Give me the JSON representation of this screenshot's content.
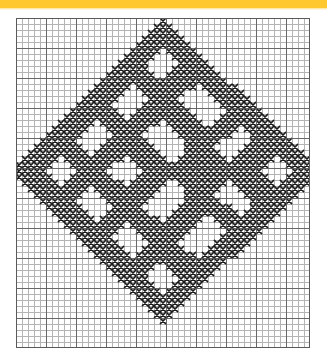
{
  "document": {
    "type": "cross-stitch-chart",
    "background_color": "#ffffff"
  },
  "banner": {
    "color": "#ffc82e",
    "height_px": 8,
    "label": ""
  },
  "chart_data": {
    "type": "heatmap",
    "title": "",
    "subtitle": "",
    "xlabel": "",
    "ylabel": "",
    "grid": true,
    "legend_position": "none",
    "columns": 49,
    "rows": 55,
    "cell_px": 6,
    "origin_x_px": 16,
    "origin_y_px": 18,
    "stitch_symbol": "X",
    "stitch_color": "#1a1a1a",
    "empty_color": "#ffffff",
    "thin_line_color": "#b4b4b4",
    "heavy_line_color": "#5a5a5a",
    "heavy_line_every": 5,
    "x": [
      0,
      1,
      2,
      3,
      4,
      5,
      6,
      7,
      8,
      9,
      10,
      11,
      12,
      13,
      14,
      15,
      16,
      17,
      18,
      19,
      20,
      21,
      22,
      23,
      24,
      25,
      26,
      27,
      28,
      29,
      30,
      31,
      32,
      33,
      34,
      35,
      36,
      37,
      38,
      39,
      40,
      41,
      42,
      43,
      44,
      45,
      46,
      47,
      48
    ],
    "pattern_rows": [
      "0000000000000000000000001000000000000000000000000",
      "0000000000000000000000011100000000000000000000000",
      "0000000000000000000000111110000000000000000000000",
      "0000000000000000000001111111000000000000000000000",
      "0000000000000000000011111111100000000000000000000",
      "0000000000000000000111110111110000000000000000000",
      "0000000000000000001111100011111000000000000000000",
      "0000000000000000011111000001111100000000000000000",
      "0000000000000000111111000011111110000000000000000",
      "0000000000000001111111100111111111000000000000000",
      "0000000000000011111111111111111111100000000000000",
      "0000000000000111111011111111110111111000000000000",
      "0000000000001111110001111111000011111100000000000",
      "0000000000011111100000111110000001111110000000000",
      "0000000000111111000001111111000000111111000000000",
      "0000000001111111100011111111100000011111100000000",
      "0000000011111111110111111111110000111111110000000",
      "0000000111111011111111110111111001111111111000000",
      "0000001111110001111111000011111111111011111100000",
      "0000011111100000111110000001111111110001111110000",
      "0000111111000001111111000000111111000001111111000",
      "0001111111100011111111100000111110000011111111100",
      "0011111111110111111111110000111111000111111111110",
      "0111111011111111110111111001111111101111111011111",
      "1111110001111111000011111111111111111111110001111",
      "1111100000111110000001111111111111111111100000111",
      "1111110001111111000011111111111111111111110001111",
      "0111111011111111110111111001111111101111111011111",
      "0011111111110111111111110000111111000111111111110",
      "0001111111100011111111100000111110000011111111100",
      "0000111111000001111111000000111111000001111111000",
      "0000011111100000111110000001111111110001111110000",
      "0000001111110001111111000011111111111011111100000",
      "0000000111111011111111110111111001111111111000000",
      "0000000011111111110111111111110000111111110000000",
      "0000000001111111100011111111100000011111100000000",
      "0000000000111111000001111111000000111111000000000",
      "0000000000011111100000111110000001111110000000000",
      "0000000000001111110001111111000011111100000000000",
      "0000000000000111111011111111110111111000000000000",
      "0000000000000011111111111111111111100000000000000",
      "0000000000000001111111100111111111000000000000000",
      "0000000000000000111111000011111110000000000000000",
      "0000000000000000011111000001111100000000000000000",
      "0000000000000000001111100011111000000000000000000",
      "0000000000000000000111110111110000000000000000000",
      "0000000000000000000011111111100000000000000000000",
      "0000000000000000000001111111000000000000000000000",
      "0000000000000000000000111110000000000000000000000",
      "0000000000000000000000011100000000000000000000000",
      "0000000000000000000000001000000000000000000000000",
      "0000000000000000000000000000000000000000000000000",
      "0000000000000000000000000000000000000000000000000",
      "0000000000000000000000000000000000000000000000000",
      "0000000000000000000000000000000000000000000000000"
    ]
  }
}
